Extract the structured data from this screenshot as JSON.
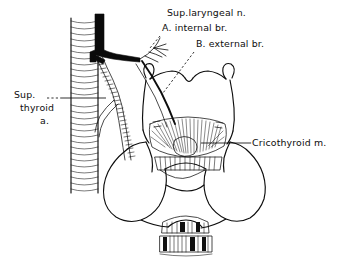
{
  "figure": {
    "background_color": "#ffffff",
    "ink_color": "#0d0d0d",
    "style": "black-and-white anatomical line drawing with hatching"
  },
  "labels": {
    "sup_laryngeal_nerve": {
      "text": "Sup.laryngeal n.",
      "x": 167,
      "y": 16
    },
    "internal_branch": {
      "text": "A. internal br.",
      "x": 162,
      "y": 31
    },
    "external_branch": {
      "text": "B. external br.",
      "x": 196,
      "y": 47
    },
    "sup_thyroid_artery": {
      "line1": "Sup.",
      "line2": "thyroid",
      "line3": "a.",
      "x1": 14,
      "y1": 98,
      "x2": 20,
      "y2": 111,
      "x3": 40,
      "y3": 124
    },
    "cricothyroid_muscle": {
      "text": "Cricothyroid m.",
      "x": 252,
      "y": 146
    }
  },
  "structures": {
    "trachea_esophagus_band": "vertical hatched column at left",
    "carotid_artery": "thick black vessel descending then branching right",
    "superior_thyroid_artery": "stippled tube descending diagonally",
    "superior_laryngeal_nerve": "fine branching nerve fibers",
    "thyroid_cartilage": "laryngeal cartilage with superior horns and notch",
    "cricothyroid_muscle": "fan of radiating muscle fibers",
    "thyroid_gland": "two lobulated lobes joined by isthmus",
    "trachea_rings": "cartilage rings with alternating dark segments"
  }
}
